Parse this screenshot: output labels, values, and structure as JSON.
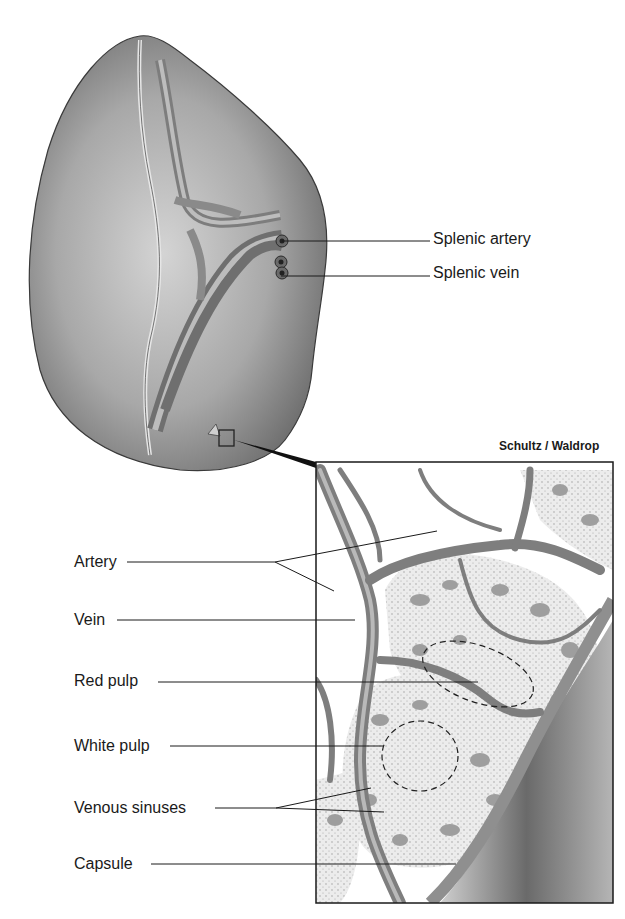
{
  "figure": {
    "credit": "Schultz / Waldrop",
    "colors": {
      "background": "#ffffff",
      "organ_fill": "#a9a9a9",
      "organ_shadow": "#7a7a7a",
      "organ_highlight": "#d6d6d6",
      "vessel": "#8a8a8a",
      "vessel_light": "#c8c8c8",
      "pulp_fill": "#9a9a9a",
      "sinus_bg": "#e8e8e8",
      "line": "#1a1a1a"
    }
  },
  "labels": {
    "splenic_artery": "Splenic artery",
    "splenic_vein": "Splenic vein",
    "artery": "Artery",
    "vein": "Vein",
    "red_pulp": "Red pulp",
    "white_pulp": "White pulp",
    "venous_sinuses": "Venous sinuses",
    "capsule": "Capsule"
  }
}
